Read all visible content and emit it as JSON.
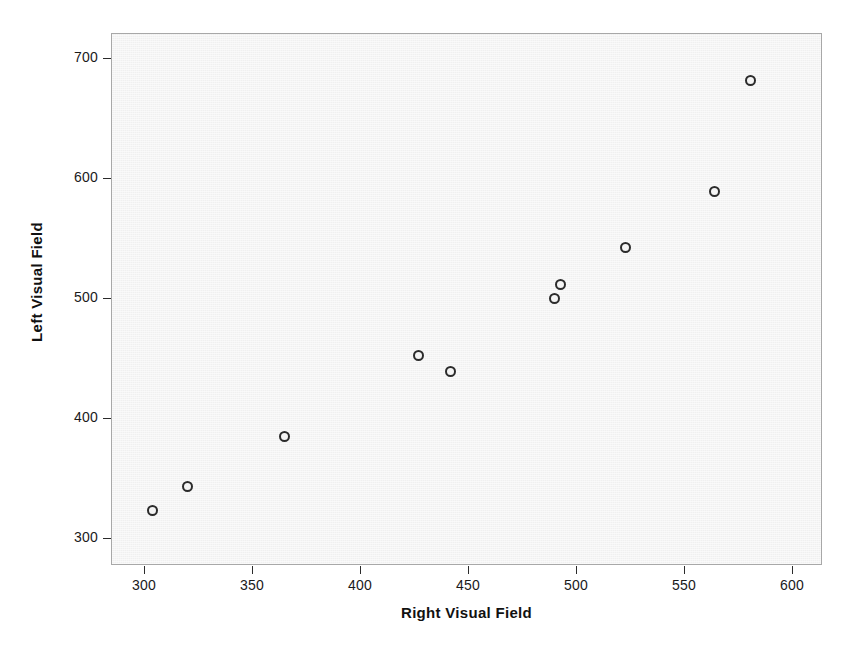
{
  "chart_data": {
    "type": "scatter",
    "title": "",
    "xlabel": "Right Visual Field",
    "ylabel": "Left Visual Field",
    "xlim": [
      280,
      618
    ],
    "ylim": [
      288,
      740
    ],
    "xticks": [
      300,
      350,
      400,
      450,
      500,
      550,
      600
    ],
    "xtick_labels": [
      "300",
      "350",
      "400",
      "450",
      "500",
      "550",
      "600"
    ],
    "yticks": [
      300,
      400,
      500,
      600,
      700
    ],
    "ytick_labels": [
      "300",
      "400",
      "500",
      "600",
      "700"
    ],
    "grid": false,
    "legend": null,
    "marker": "open-circle",
    "marker_edge_color": "#2b2b2b",
    "plot_background_color": "#f0f0f0",
    "frame_color": "#a8a8a8",
    "points": [
      {
        "x": 304,
        "y": 323
      },
      {
        "x": 320,
        "y": 343
      },
      {
        "x": 365,
        "y": 385
      },
      {
        "x": 427,
        "y": 452
      },
      {
        "x": 442,
        "y": 439
      },
      {
        "x": 490,
        "y": 500
      },
      {
        "x": 493,
        "y": 511
      },
      {
        "x": 523,
        "y": 542
      },
      {
        "x": 564,
        "y": 589
      },
      {
        "x": 581,
        "y": 681
      }
    ]
  }
}
